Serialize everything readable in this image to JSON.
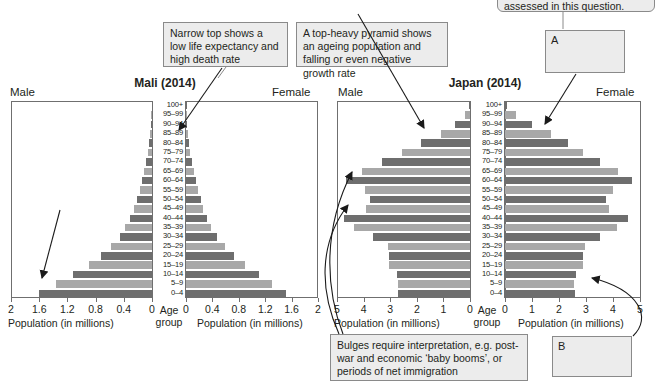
{
  "annotations": {
    "narrow_top": "Narrow top shows a low life expectancy and high death rate",
    "top_heavy": "A top-heavy pyramid shows an ageing population and falling or even negative growth rate",
    "flared_base": "Flared base shows high birth rates and rising population growth rate",
    "bulges": "Bulges require interpretation, e.g. post-war and economic ‘baby booms’, or periods of net immigration",
    "clipped_top_note": "assessed in this question.",
    "label_a": "A",
    "label_b": "B"
  },
  "chart_data": [
    {
      "type": "bar",
      "id": "mali",
      "title": "Mali (2014)",
      "left_series_label": "Male",
      "right_series_label": "Female",
      "xlabel": "Population (in millions)",
      "center_axis_label": "Age group",
      "xlim": [
        0,
        2
      ],
      "xticks": [
        "2",
        "1.6",
        "1.2",
        "0.8",
        "0.4",
        "0"
      ],
      "xticks_right": [
        "0",
        "0.4",
        "0.8",
        "1.2",
        "1.6",
        "2"
      ],
      "grid": false,
      "categories": [
        "100+",
        "95–99",
        "90–94",
        "85–89",
        "80–84",
        "75–79",
        "70–74",
        "65–69",
        "60–64",
        "55–59",
        "50–54",
        "45–49",
        "40–44",
        "35–39",
        "30–34",
        "25–29",
        "20–24",
        "15–19",
        "10–14",
        "5–9",
        "0–4"
      ],
      "series": [
        {
          "name": "Male",
          "values": [
            0.005,
            0.01,
            0.02,
            0.03,
            0.045,
            0.06,
            0.085,
            0.11,
            0.14,
            0.175,
            0.215,
            0.26,
            0.31,
            0.38,
            0.46,
            0.58,
            0.72,
            0.9,
            1.12,
            1.36,
            1.6
          ]
        },
        {
          "name": "Female",
          "values": [
            0.005,
            0.012,
            0.022,
            0.034,
            0.05,
            0.068,
            0.09,
            0.115,
            0.145,
            0.18,
            0.22,
            0.265,
            0.315,
            0.385,
            0.465,
            0.585,
            0.725,
            0.9,
            1.1,
            1.3,
            1.52
          ]
        }
      ]
    },
    {
      "type": "bar",
      "id": "japan",
      "title": "Japan (2014)",
      "left_series_label": "Male",
      "right_series_label": "Female",
      "xlabel": "Population (in millions)",
      "center_axis_label": "Age group",
      "xlim": [
        0,
        5
      ],
      "xticks": [
        "5",
        "4",
        "3",
        "2",
        "1",
        "0"
      ],
      "xticks_right": [
        "0",
        "1",
        "2",
        "3",
        "4",
        "5"
      ],
      "grid": false,
      "categories": [
        "100+",
        "95–99",
        "90–94",
        "85–89",
        "80–84",
        "75–79",
        "70–74",
        "65–69",
        "60–64",
        "55–59",
        "50–54",
        "45–49",
        "40–44",
        "35–39",
        "30–34",
        "25–29",
        "20–24",
        "15–19",
        "10–14",
        "5–9",
        "0–4"
      ],
      "series": [
        {
          "name": "Male",
          "values": [
            0.02,
            0.18,
            0.55,
            1.1,
            1.85,
            2.55,
            3.3,
            4.05,
            4.65,
            3.95,
            3.75,
            3.9,
            4.75,
            4.35,
            3.65,
            3.1,
            3.05,
            3.05,
            2.75,
            2.7,
            2.7
          ]
        },
        {
          "name": "Female",
          "values": [
            0.06,
            0.42,
            1.0,
            1.7,
            2.35,
            2.9,
            3.5,
            4.2,
            4.7,
            4.0,
            3.75,
            3.85,
            4.55,
            4.15,
            3.5,
            2.95,
            2.9,
            2.9,
            2.62,
            2.55,
            2.58
          ]
        }
      ]
    }
  ]
}
